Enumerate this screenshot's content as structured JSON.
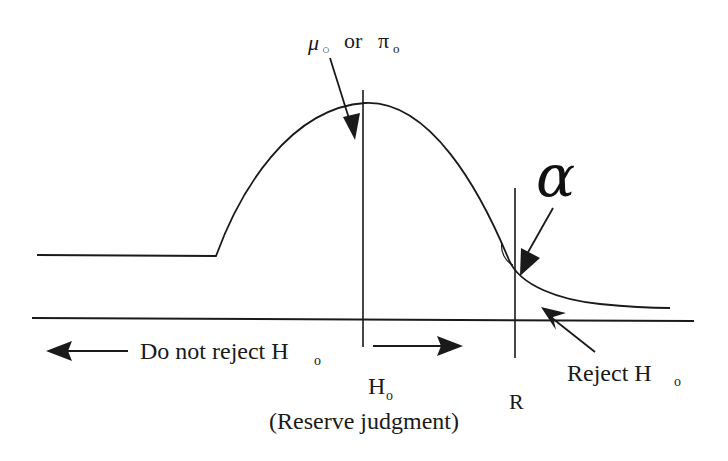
{
  "labels": {
    "mean_label_mu": "μ",
    "mean_label_mu_sub": "○",
    "mean_label_or": "or",
    "mean_label_pi": "π",
    "mean_label_pi_sub": "o",
    "alpha": "α",
    "do_not_reject": "Do not reject H",
    "do_not_reject_sub": "o",
    "h0": "H",
    "h0_sub": "o",
    "reserve_judgment": "(Reserve judgment)",
    "r_marker": "R",
    "reject": "Reject H",
    "reject_sub": "o"
  },
  "elements": {
    "curve": "distribution curve peaking at null hypothesis value",
    "center_line": "vertical line at μo / πo",
    "critical_line": "vertical line at critical value R",
    "axis": "horizontal axis"
  },
  "colors": {
    "ink": "#1a1a1a",
    "background": "#ffffff"
  }
}
